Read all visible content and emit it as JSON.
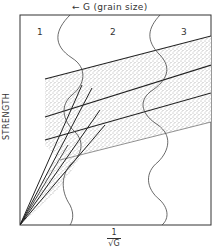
{
  "diagram": {
    "top_label": {
      "arrow": "←",
      "text": "G (grain size)"
    },
    "zones": [
      {
        "label": "1"
      },
      {
        "label": "2"
      },
      {
        "label": "3"
      }
    ],
    "y_axis": {
      "label": "STRENGTH"
    },
    "x_axis": {
      "numerator": "1",
      "denominator": "√G"
    },
    "colors": {
      "line": "#222222",
      "stipple": "#555555",
      "background": "#ffffff"
    }
  }
}
